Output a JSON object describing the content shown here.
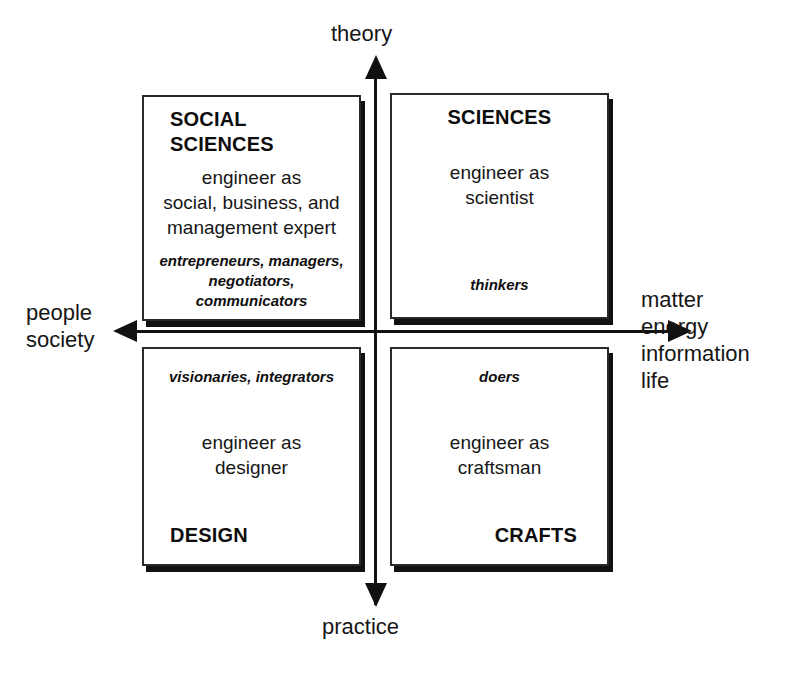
{
  "diagram": {
    "axes": {
      "vertical": {
        "top_label": "theory",
        "bottom_label": "practice",
        "top_arrow_icon": "arrow-up-icon",
        "bottom_arrow_icon": "arrow-down-icon"
      },
      "horizontal": {
        "left_label": "people\nsociety",
        "right_label": "matter\nenergy\ninformation\nlife",
        "left_arrow_icon": "arrow-left-icon",
        "right_arrow_icon": "arrow-right-icon"
      }
    },
    "quadrants": {
      "top_left": {
        "heading": "SOCIAL\nSCIENCES",
        "body": "engineer as\nsocial, business, and\nmanagement expert",
        "roles": "entrepreneurs, managers,\nnegotiators, communicators"
      },
      "top_right": {
        "heading": "SCIENCES",
        "body": "engineer as\nscientist",
        "roles": "thinkers"
      },
      "bottom_left": {
        "heading": "DESIGN",
        "body": "engineer as\ndesigner",
        "roles": "visionaries, integrators"
      },
      "bottom_right": {
        "heading": "CRAFTS",
        "body": "engineer as\ncraftsman",
        "roles": "doers"
      }
    },
    "colors": {
      "background": "#ffffff",
      "stroke": "#2a2a2a",
      "shadow": "#111111",
      "text": "#161616"
    }
  }
}
